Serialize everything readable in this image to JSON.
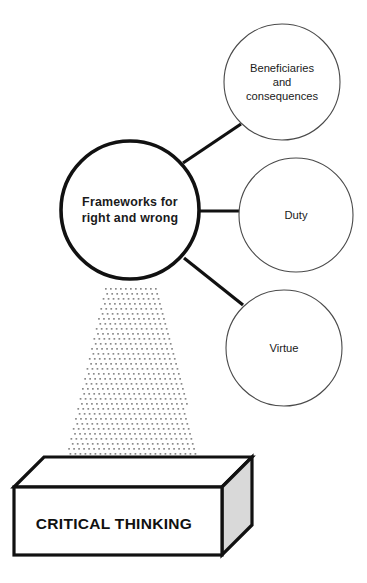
{
  "diagram": {
    "type": "hub-and-spoke concept diagram on a base block",
    "colors": {
      "stroke_dark": "#111111",
      "stroke_light": "#4a4a4a",
      "fill_white": "#ffffff",
      "box_side_gray": "#d9d9d9",
      "beam_dot": "#8a8a8a",
      "text": "#1a1a1a"
    },
    "hub": {
      "name": "frameworks-hub",
      "line1": "Frameworks for",
      "line2": "right and wrong",
      "cx": 130,
      "cy": 210,
      "r": 69,
      "stroke_width": 3.6
    },
    "satellites": [
      {
        "name": "beneficiaries-and-consequences",
        "lines": [
          "Beneficiaries",
          "and",
          "consequences"
        ],
        "cx": 282,
        "cy": 82,
        "r": 58,
        "stroke_width": 1.1
      },
      {
        "name": "duty",
        "lines": [
          "Duty"
        ],
        "cx": 296,
        "cy": 215,
        "r": 57,
        "stroke_width": 1.1
      },
      {
        "name": "virtue",
        "lines": [
          "Virtue"
        ],
        "cx": 284,
        "cy": 348,
        "r": 58,
        "stroke_width": 1.1
      }
    ],
    "connectors": [
      {
        "name": "connector-to-beneficiaries",
        "x1": 183,
        "y1": 163,
        "x2": 241,
        "y2": 124
      },
      {
        "name": "connector-to-duty",
        "x1": 199,
        "y1": 211,
        "x2": 239,
        "y2": 211
      },
      {
        "name": "connector-to-virtue",
        "x1": 184,
        "y1": 258,
        "x2": 243,
        "y2": 305
      }
    ],
    "beam": {
      "name": "critical-thinking-beam",
      "top_left_x": 105,
      "top_right_x": 159,
      "top_y": 288,
      "bottom_left_x": 62,
      "bottom_right_x": 203,
      "bottom_y": 475,
      "dot_spacing": 5,
      "dot_radius": 0.85
    },
    "base": {
      "name": "critical-thinking-base",
      "label": "CRITICAL THINKING",
      "front": {
        "x": 14,
        "y": 487,
        "w": 208,
        "h": 68
      },
      "depth_dx": 30,
      "depth_dy": -30,
      "stroke_width": 3.2
    }
  }
}
